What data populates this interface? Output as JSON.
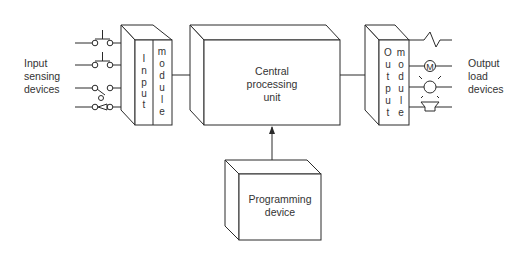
{
  "diagram": {
    "input_label": [
      "Input",
      "sensing",
      "devices"
    ],
    "output_label": [
      "Output",
      "load",
      "devices"
    ],
    "input_module": {
      "col1": [
        "I",
        "n",
        "p",
        "u",
        "t"
      ],
      "col2": [
        "m",
        "o",
        "d",
        "u",
        "l",
        "e"
      ]
    },
    "output_module": {
      "col1": [
        "O",
        "u",
        "t",
        "p",
        "u",
        "t"
      ],
      "col2": [
        "m",
        "o",
        "d",
        "u",
        "l",
        "e"
      ]
    },
    "cpu": {
      "lines": [
        "Central",
        "processing",
        "unit"
      ]
    },
    "programming_device": {
      "lines": [
        "Programming",
        "device"
      ]
    },
    "input_devices": [
      "pushbutton-no",
      "pushbutton-no",
      "limit-switch",
      "pressure-switch"
    ],
    "output_devices": [
      "heater",
      "motor",
      "lamp",
      "horn"
    ],
    "motor_symbol": "M",
    "line_color": "#2a2a2a"
  }
}
